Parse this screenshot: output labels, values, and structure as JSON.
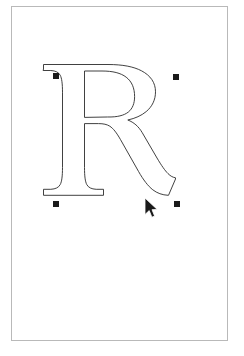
{
  "app": {
    "title": "Vector Path Editor",
    "document_name": "R"
  },
  "canvas": {
    "name": "artboard",
    "background_color": "#ffffff",
    "border_color": "#b9b9b9",
    "width_px": 217,
    "height_px": 335,
    "x_px": 11,
    "y_px": 6
  },
  "artwork": {
    "type": "glyph-outline-path",
    "character": "R",
    "typeface_style": "serif",
    "stroke_color": "#2b2b2b",
    "fill": "none",
    "stroke_width": 0.9,
    "bounds": {
      "x": 41,
      "y": 66,
      "width": 126,
      "height": 133
    },
    "path_description": "Outline contour of a serif capital letter R with bracketed serifs, closed counter in the bowl, and a splayed leg"
  },
  "selection": {
    "label": "Selected path",
    "handle_color": "#1a1a1a",
    "handle_size_px": 6,
    "handles": [
      {
        "name": "handle-top-left",
        "x": 41,
        "y": 66,
        "role": "bounding-box-corner"
      },
      {
        "name": "handle-top-right",
        "x": 161,
        "y": 67,
        "role": "bounding-box-corner"
      },
      {
        "name": "handle-bottom-left",
        "x": 41,
        "y": 194,
        "role": "bounding-box-corner"
      },
      {
        "name": "handle-bottom-right",
        "x": 162,
        "y": 194,
        "role": "bounding-box-corner"
      }
    ]
  },
  "cursor": {
    "type": "arrow-pointer",
    "color": "#1a1a1a",
    "x": 144,
    "y": 197
  }
}
